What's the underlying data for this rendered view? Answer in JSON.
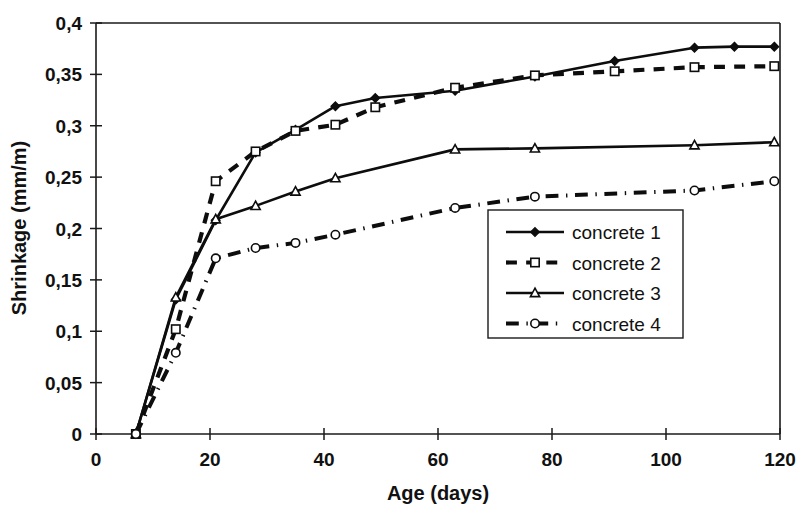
{
  "chart_data": {
    "type": "line",
    "title": "",
    "xlabel": "Age (days)",
    "ylabel": "Shrinkage (mm/m)",
    "xlim": [
      0,
      120
    ],
    "ylim": [
      0,
      0.4
    ],
    "xticks": [
      0,
      20,
      40,
      60,
      80,
      100,
      120
    ],
    "xtick_labels": [
      "0",
      "20",
      "40",
      "60",
      "80",
      "100",
      "120"
    ],
    "yticks": [
      0,
      0.05,
      0.1,
      0.15,
      0.2,
      0.25,
      0.3,
      0.35,
      0.4
    ],
    "ytick_labels": [
      "0",
      "0,05",
      "0,1",
      "0,15",
      "0,2",
      "0,25",
      "0,3",
      "0,35",
      "0,4"
    ],
    "decimal_separator": ",",
    "grid": false,
    "legend_position": "center-right",
    "series": [
      {
        "name": "concrete 1",
        "linestyle": "solid",
        "marker": "filled-diamond",
        "color": "#0d0d0d",
        "x": [
          7,
          14,
          21,
          28,
          35,
          42,
          49,
          63,
          77,
          91,
          105,
          112,
          119
        ],
        "y": [
          0.0,
          0.131,
          0.208,
          0.274,
          0.296,
          0.319,
          0.327,
          0.334,
          0.348,
          0.363,
          0.376,
          0.377,
          0.377
        ]
      },
      {
        "name": "concrete 2",
        "linestyle": "dashed",
        "marker": "open-square",
        "color": "#0d0d0d",
        "x": [
          7,
          14,
          21,
          28,
          35,
          42,
          49,
          63,
          77,
          91,
          105,
          119
        ],
        "y": [
          0.0,
          0.102,
          0.246,
          0.275,
          0.295,
          0.301,
          0.318,
          0.337,
          0.349,
          0.353,
          0.357,
          0.358
        ]
      },
      {
        "name": "concrete 3",
        "linestyle": "solid",
        "marker": "open-triangle",
        "color": "#0d0d0d",
        "x": [
          7,
          14,
          21,
          28,
          35,
          42,
          63,
          77,
          105,
          119
        ],
        "y": [
          0.0,
          0.133,
          0.209,
          0.222,
          0.236,
          0.249,
          0.277,
          0.278,
          0.281,
          0.284
        ]
      },
      {
        "name": "concrete 4",
        "linestyle": "dash-dot",
        "marker": "open-circle",
        "color": "#0d0d0d",
        "x": [
          7,
          14,
          21,
          28,
          35,
          42,
          63,
          77,
          105,
          119
        ],
        "y": [
          0.0,
          0.079,
          0.171,
          0.181,
          0.186,
          0.194,
          0.22,
          0.231,
          0.237,
          0.246
        ]
      }
    ]
  },
  "legend": {
    "entries": [
      {
        "label": "concrete 1"
      },
      {
        "label": "concrete 2"
      },
      {
        "label": "concrete 3"
      },
      {
        "label": "concrete 4"
      }
    ]
  },
  "axes": {
    "x_title": "Age (days)",
    "y_title": "Shrinkage (mm/m)"
  }
}
